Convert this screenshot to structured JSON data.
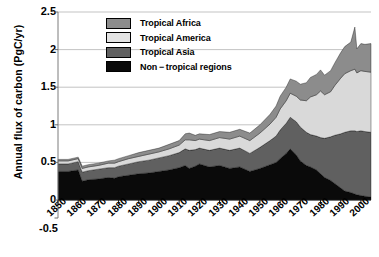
{
  "chart_data": {
    "type": "area",
    "title": "",
    "xlabel": "",
    "ylabel": "Annual flux of carbon (PgC/yr)",
    "xlim": [
      1850,
      2005
    ],
    "ylim": [
      -0.5,
      2.5
    ],
    "yticks": [
      2.5,
      2,
      1.5,
      1,
      0.5,
      0,
      -0.5
    ],
    "ytick_labels": [
      "2.5",
      "2",
      "1.5",
      "1",
      "0.5",
      "0",
      "-0.5"
    ],
    "xticks": [
      1850,
      1860,
      1870,
      1880,
      1890,
      1900,
      1910,
      1920,
      1930,
      1940,
      1950,
      1960,
      1970,
      1980,
      1990,
      2000
    ],
    "xtick_labels": [
      "1850",
      "1860",
      "1870",
      "1880",
      "1890",
      "1900",
      "1910",
      "1920",
      "1930",
      "1940",
      "1950",
      "1960",
      "1970",
      "1980",
      "1990",
      "2000"
    ],
    "grid": true,
    "grid_axis": "y",
    "stacked": true,
    "legend_position": "upper-center",
    "x": [
      1850,
      1855,
      1860,
      1862,
      1865,
      1870,
      1875,
      1878,
      1880,
      1885,
      1890,
      1895,
      1900,
      1905,
      1910,
      1913,
      1915,
      1918,
      1920,
      1925,
      1930,
      1935,
      1940,
      1945,
      1950,
      1955,
      1958,
      1960,
      1963,
      1965,
      1968,
      1970,
      1973,
      1975,
      1978,
      1980,
      1982,
      1985,
      1987,
      1990,
      1992,
      1995,
      1997,
      1998,
      2000,
      2002,
      2005
    ],
    "series": [
      {
        "name": "Non-tropical regions",
        "color": "#0a0a0a",
        "values": [
          0.38,
          0.38,
          0.4,
          0.25,
          0.27,
          0.28,
          0.3,
          0.29,
          0.31,
          0.33,
          0.35,
          0.36,
          0.38,
          0.4,
          0.43,
          0.46,
          0.42,
          0.45,
          0.48,
          0.44,
          0.46,
          0.42,
          0.44,
          0.38,
          0.42,
          0.47,
          0.5,
          0.55,
          0.62,
          0.68,
          0.6,
          0.52,
          0.46,
          0.44,
          0.4,
          0.35,
          0.3,
          0.26,
          0.22,
          0.16,
          0.12,
          0.1,
          0.08,
          0.07,
          0.06,
          0.05,
          0.04
        ]
      },
      {
        "name": "Tropical Asia",
        "color": "#606060",
        "values": [
          0.1,
          0.1,
          0.11,
          0.12,
          0.12,
          0.13,
          0.13,
          0.14,
          0.14,
          0.15,
          0.16,
          0.17,
          0.18,
          0.19,
          0.2,
          0.22,
          0.24,
          0.22,
          0.21,
          0.22,
          0.23,
          0.24,
          0.25,
          0.24,
          0.28,
          0.32,
          0.35,
          0.38,
          0.4,
          0.42,
          0.44,
          0.45,
          0.44,
          0.43,
          0.45,
          0.48,
          0.52,
          0.58,
          0.64,
          0.72,
          0.78,
          0.82,
          0.84,
          0.84,
          0.86,
          0.86,
          0.86
        ]
      },
      {
        "name": "Tropical America",
        "color": "#d9d9d9",
        "values": [
          0.04,
          0.04,
          0.04,
          0.05,
          0.05,
          0.05,
          0.06,
          0.06,
          0.06,
          0.07,
          0.07,
          0.08,
          0.08,
          0.09,
          0.1,
          0.12,
          0.14,
          0.12,
          0.12,
          0.13,
          0.14,
          0.15,
          0.16,
          0.17,
          0.19,
          0.22,
          0.25,
          0.28,
          0.3,
          0.32,
          0.34,
          0.36,
          0.42,
          0.5,
          0.55,
          0.62,
          0.58,
          0.6,
          0.66,
          0.74,
          0.78,
          0.8,
          0.82,
          0.78,
          0.8,
          0.8,
          0.8
        ]
      },
      {
        "name": "Tropical Africa",
        "color": "#8c8c8c",
        "values": [
          0.02,
          0.02,
          0.02,
          0.03,
          0.03,
          0.03,
          0.03,
          0.04,
          0.04,
          0.04,
          0.05,
          0.05,
          0.05,
          0.06,
          0.06,
          0.08,
          0.09,
          0.07,
          0.07,
          0.08,
          0.08,
          0.09,
          0.09,
          0.1,
          0.11,
          0.13,
          0.15,
          0.17,
          0.18,
          0.19,
          0.2,
          0.21,
          0.24,
          0.26,
          0.27,
          0.28,
          0.26,
          0.28,
          0.3,
          0.34,
          0.36,
          0.38,
          0.56,
          0.32,
          0.36,
          0.36,
          0.38
        ]
      }
    ]
  },
  "legend": {
    "items": [
      {
        "label": "Tropical Africa",
        "color": "#8c8c8c"
      },
      {
        "label": "Tropical America",
        "color": "#e3e3e3"
      },
      {
        "label": "Tropical Asia",
        "color": "#606060"
      },
      {
        "label": "Non − tropical regions",
        "color": "#0a0a0a"
      }
    ]
  },
  "axes": {
    "ylabel": "Annual flux of carbon (PgC/yr)"
  }
}
